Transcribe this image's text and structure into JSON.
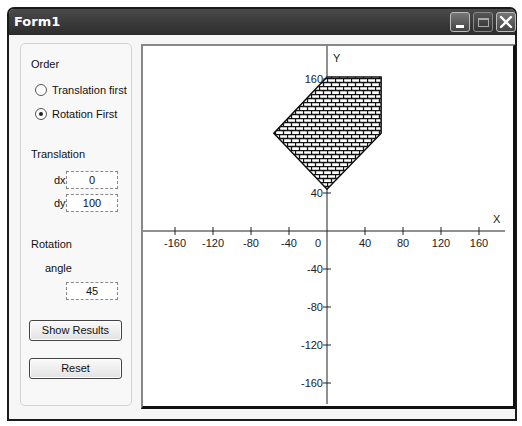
{
  "window": {
    "title": "Form1",
    "buttons": [
      "minimize",
      "maximize",
      "close"
    ]
  },
  "controls": {
    "order_label": "Order",
    "radio_options": [
      {
        "label": "Translation first",
        "checked": false
      },
      {
        "label": "Rotation First",
        "checked": true
      }
    ],
    "translation_label": "Translation",
    "dx_label": "dx",
    "dx_value": "0",
    "dy_label": "dy",
    "dy_value": "100",
    "rotation_label": "Rotation",
    "angle_label": "angle",
    "angle_value": "45",
    "show_results_label": "Show Results",
    "reset_label": "Reset"
  },
  "chart_data": {
    "type": "scatter",
    "title": "",
    "xlabel": "X",
    "ylabel": "Y",
    "xlim": [
      -190,
      190
    ],
    "ylim": [
      -190,
      190
    ],
    "x_ticks": [
      -160,
      -120,
      -80,
      -40,
      40,
      80,
      120,
      160
    ],
    "x_tick_labels": [
      "-160",
      "-120",
      "-80",
      "-40",
      "0",
      "40",
      "80",
      "120",
      "160"
    ],
    "y_ticks": [
      160,
      40,
      -40,
      -80,
      -120,
      -160
    ],
    "y_tick_labels": [
      "160",
      "40",
      "-40",
      "-80",
      "-120",
      "-160"
    ],
    "grid": false,
    "polygon": {
      "fill_pattern": "brick",
      "vertices": [
        [
          0,
          162
        ],
        [
          57,
          162
        ],
        [
          57,
          103
        ],
        [
          0,
          44
        ],
        [
          -56,
          103
        ]
      ]
    }
  }
}
